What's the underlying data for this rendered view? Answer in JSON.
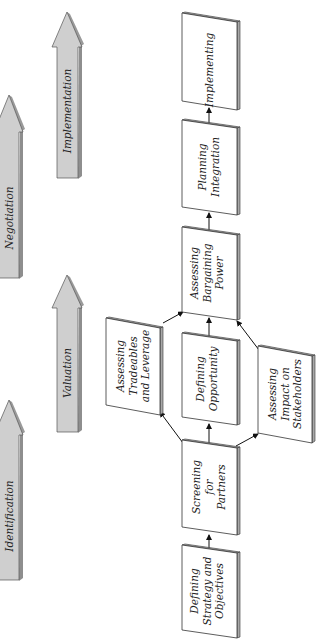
{
  "diagram": {
    "orientation": "rotated-90-ccw",
    "colors": {
      "box_face": "#ffffff",
      "box_edge": "#333333",
      "box_shadow": "#a8a8a8",
      "phase_arrow_fill": "#cfcfcf",
      "phase_arrow_edge": "#555555",
      "connector": "#111111"
    },
    "phases": [
      {
        "id": "identification",
        "label": "Identification"
      },
      {
        "id": "valuation",
        "label": "Valuation"
      },
      {
        "id": "negotiation",
        "label": "Negotiation"
      },
      {
        "id": "implementation",
        "label": "Implementation"
      }
    ],
    "boxes": [
      {
        "id": "defining-strategy",
        "label": "Defining\nStrategy and\nObjectives"
      },
      {
        "id": "screening-partners",
        "label": "Screening\nfor\nPartners"
      },
      {
        "id": "assessing-tradeables",
        "label": "Assessing\nTradeables\nand Leverage"
      },
      {
        "id": "defining-opportunity",
        "label": "Defining\nOpportunity"
      },
      {
        "id": "assessing-impact",
        "label": "Assessing\nImpact on\nStakeholders"
      },
      {
        "id": "assessing-bargaining",
        "label": "Assessing\nBargaining\nPower"
      },
      {
        "id": "planning-integration",
        "label": "Planning\nIntegration"
      },
      {
        "id": "implementing",
        "label": "Implementing"
      }
    ],
    "connections": [
      {
        "from": "defining-strategy",
        "to": "screening-partners"
      },
      {
        "from": "screening-partners",
        "to": "assessing-tradeables"
      },
      {
        "from": "screening-partners",
        "to": "defining-opportunity"
      },
      {
        "from": "screening-partners",
        "to": "assessing-impact"
      },
      {
        "from": "assessing-tradeables",
        "to": "assessing-bargaining"
      },
      {
        "from": "defining-opportunity",
        "to": "assessing-bargaining"
      },
      {
        "from": "assessing-impact",
        "to": "assessing-bargaining"
      },
      {
        "from": "assessing-bargaining",
        "to": "planning-integration"
      },
      {
        "from": "planning-integration",
        "to": "implementing"
      }
    ]
  }
}
